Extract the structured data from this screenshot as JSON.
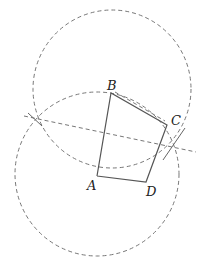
{
  "diagram": {
    "type": "geometric-construction",
    "points": {
      "A": {
        "label": "A",
        "x": 97,
        "y": 176
      },
      "B": {
        "label": "B",
        "x": 111,
        "y": 93
      },
      "C": {
        "label": "C",
        "x": 167,
        "y": 125
      },
      "D": {
        "label": "D",
        "x": 146,
        "y": 182
      }
    },
    "labels": [
      "A",
      "B",
      "C",
      "D"
    ],
    "segments_solid": [
      "AB",
      "BC",
      "CD",
      "DA"
    ],
    "circles_dashed": [
      {
        "name": "circle-upper",
        "cx": 112,
        "cy": 89,
        "r": 79
      },
      {
        "name": "circle-lower",
        "cx": 97,
        "cy": 174,
        "r": 82
      }
    ],
    "intersections": [
      {
        "x": 35,
        "y": 119
      },
      {
        "x": 173,
        "y": 146
      }
    ],
    "colors": {
      "stroke": "#555555",
      "dash": "#777777"
    }
  }
}
